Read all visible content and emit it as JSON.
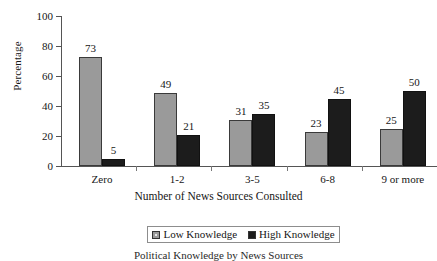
{
  "chart_data": {
    "type": "bar",
    "title": "",
    "xlabel": "Number of News Sources Consulted",
    "ylabel": "Percentage",
    "categories": [
      "Zero",
      "1-2",
      "3-5",
      "6-8",
      "9 or more"
    ],
    "series": [
      {
        "name": "Low Knowledge",
        "color": "#9a9a9a",
        "values": [
          73,
          49,
          31,
          23,
          25
        ]
      },
      {
        "name": "High Knowledge",
        "color": "#1c1c1c",
        "values": [
          5,
          21,
          35,
          45,
          50
        ]
      }
    ],
    "ylim": [
      0,
      100
    ],
    "yticks": [
      0,
      20,
      40,
      60,
      80,
      100
    ],
    "ytick_labels": [
      "0",
      "20",
      "40",
      "60",
      "80",
      "100"
    ],
    "grid": false,
    "legend_position": "bottom",
    "data_labels": true
  },
  "caption": "Political Knowledge by News Sources",
  "colors": {
    "low_knowledge": "#9a9a9a",
    "high_knowledge": "#1c1c1c",
    "axis": "#555555",
    "text": "#161616"
  }
}
